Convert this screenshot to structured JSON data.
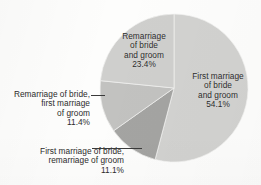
{
  "chart_data": {
    "type": "pie",
    "title": "",
    "subtitle": "",
    "xlabel": "",
    "ylabel": "",
    "legend_position": "none",
    "grid": false,
    "units": "percent",
    "total": 100.0,
    "categories": [
      "First marriage of bride and groom",
      "First marriage of bride, remarriage of groom",
      "Remarriage of bride, first marriage of groom",
      "Remarriage of bride and groom"
    ],
    "values": [
      54.1,
      11.1,
      11.4,
      23.4
    ],
    "slices": [
      {
        "id": "first-both",
        "label": "First marriage\nof bride\nand groom",
        "label_flat": "First marriage of bride and groom",
        "value": 54.1,
        "value_text": "54.1%",
        "color": "#d2d2d0",
        "start_angle_deg": 0,
        "end_angle_deg": 194.8,
        "label_placement": "inside"
      },
      {
        "id": "first-bride-remarriage-groom",
        "label": "First marriage of bride,\nremarriage of groom",
        "label_flat": "First marriage of bride, remarriage of groom",
        "value": 11.1,
        "value_text": "11.1%",
        "color": "#a4a4a2",
        "start_angle_deg": 194.8,
        "end_angle_deg": 234.7,
        "label_placement": "outside-left"
      },
      {
        "id": "remarriage-bride-first-groom",
        "label": "Remarriage of bride,\nfirst marriage\nof groom",
        "label_flat": "Remarriage of bride, first marriage of groom",
        "value": 11.4,
        "value_text": "11.4%",
        "color": "#c2c2c0",
        "start_angle_deg": 234.7,
        "end_angle_deg": 275.7,
        "label_placement": "outside-left"
      },
      {
        "id": "remarriage-both",
        "label": "Remarriage\nof bride\nand groom",
        "label_flat": "Remarriage of bride and groom",
        "value": 23.4,
        "value_text": "23.4%",
        "color": "#cfcfcd",
        "start_angle_deg": 275.7,
        "end_angle_deg": 360,
        "label_placement": "inside"
      }
    ]
  },
  "labels": {
    "remarriage_both": {
      "text": "Remarriage\nof bride\nand groom",
      "percent": "23.4%"
    },
    "first_both": {
      "text": "First marriage\nof bride\nand groom",
      "percent": "54.1%"
    },
    "remarriage_bride_first_groom": {
      "text": "Remarriage of bride,\nfirst marriage\nof groom",
      "percent": "11.4%"
    },
    "first_bride_remarriage_groom": {
      "text": "First marriage of bride,\nremarriage of groom",
      "percent": "11.1%"
    }
  },
  "geometry": {
    "center_x": 174,
    "center_y": 88,
    "radius": 74
  }
}
